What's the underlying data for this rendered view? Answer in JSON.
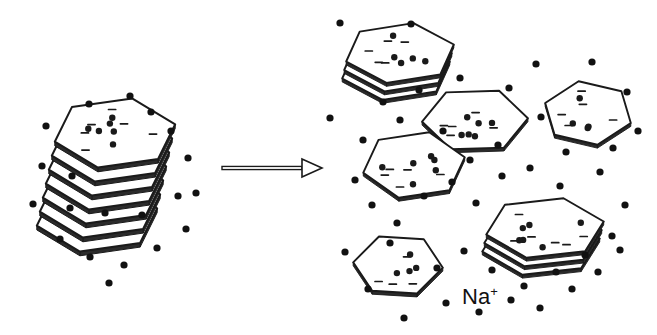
{
  "figure": {
    "background_color": "#ffffff",
    "ink_color": "#1a1a1a",
    "ion_color": "#111111",
    "platelet_face_color": "#ffffff",
    "edge_shadow_color": "#2b2b2b"
  },
  "labels": {
    "sodium_ion": "Na",
    "sodium_charge": "+"
  },
  "arrow": {
    "name": "process-arrow",
    "x1": 222,
    "y1": 168,
    "x2": 322,
    "y2": 168,
    "direction": "right",
    "style": "outlined-shaft-hollow-head"
  },
  "chart_data": {
    "type": "diagram",
    "stacks": [
      {
        "name": "intercalated-stack",
        "side": "left",
        "cx": 115,
        "cy": 175,
        "layers": 7,
        "layer_offset_x": -3.0,
        "layer_offset_y": 14.0,
        "scale": 1.0,
        "rotation": -4,
        "hex_radius": 62,
        "face_dots": 6,
        "face_dashes": 6
      }
    ],
    "platelets": [
      {
        "name": "platelet-top-right",
        "cx": 400,
        "cy": 53,
        "radius": 56,
        "rotation": -6,
        "layers": 3,
        "squash": 0.55,
        "face_dots": 5,
        "face_dashes": 5
      },
      {
        "name": "platelet-center-upper",
        "cx": 475,
        "cy": 120,
        "radius": 53,
        "rotation": 7,
        "layers": 1,
        "squash": 0.62,
        "face_dots": 6,
        "face_dashes": 5
      },
      {
        "name": "platelet-center-left",
        "cx": 414,
        "cy": 165,
        "radius": 52,
        "rotation": -3,
        "layers": 1,
        "squash": 0.66,
        "face_dots": 6,
        "face_dashes": 5
      },
      {
        "name": "platelet-right-edge",
        "cx": 588,
        "cy": 113,
        "radius": 45,
        "rotation": 28,
        "layers": 1,
        "squash": 0.72,
        "face_dots": 4,
        "face_dashes": 5
      },
      {
        "name": "platelet-bottom-left",
        "cx": 398,
        "cy": 265,
        "radius": 45,
        "rotation": 15,
        "layers": 1,
        "squash": 0.7,
        "face_dots": 4,
        "face_dashes": 4
      },
      {
        "name": "platelet-bottom-right-stack",
        "cx": 545,
        "cy": 228,
        "radius": 60,
        "rotation": -2,
        "layers": 3,
        "squash": 0.52,
        "face_dots": 6,
        "face_dashes": 6
      }
    ],
    "ions": {
      "label": "Na+",
      "radius": 3.6,
      "count_left": 20,
      "count_right": 48,
      "positions_left": [
        [
          46,
          126
        ],
        [
          89,
          104
        ],
        [
          130,
          96
        ],
        [
          42,
          166
        ],
        [
          33,
          204
        ],
        [
          60,
          239
        ],
        [
          90,
          257
        ],
        [
          124,
          265
        ],
        [
          157,
          248
        ],
        [
          186,
          229
        ],
        [
          196,
          193
        ],
        [
          188,
          158
        ],
        [
          171,
          131
        ],
        [
          151,
          112
        ],
        [
          109,
          283
        ],
        [
          70,
          208
        ],
        [
          105,
          213
        ],
        [
          72,
          176
        ],
        [
          142,
          215
        ],
        [
          178,
          196
        ]
      ],
      "positions_right": [
        [
          340,
          23
        ],
        [
          411,
          24
        ],
        [
          383,
          102
        ],
        [
          419,
          90
        ],
        [
          460,
          78
        ],
        [
          509,
          88
        ],
        [
          536,
          64
        ],
        [
          592,
          62
        ],
        [
          627,
          92
        ],
        [
          638,
          131
        ],
        [
          613,
          148
        ],
        [
          566,
          152
        ],
        [
          541,
          117
        ],
        [
          498,
          145
        ],
        [
          470,
          160
        ],
        [
          443,
          131
        ],
        [
          400,
          120
        ],
        [
          363,
          140
        ],
        [
          355,
          180
        ],
        [
          372,
          205
        ],
        [
          397,
          223
        ],
        [
          424,
          196
        ],
        [
          452,
          182
        ],
        [
          476,
          203
        ],
        [
          502,
          176
        ],
        [
          530,
          168
        ],
        [
          560,
          186
        ],
        [
          600,
          172
        ],
        [
          625,
          205
        ],
        [
          612,
          236
        ],
        [
          585,
          255
        ],
        [
          556,
          272
        ],
        [
          524,
          286
        ],
        [
          492,
          270
        ],
        [
          464,
          251
        ],
        [
          437,
          268
        ],
        [
          446,
          303
        ],
        [
          479,
          312
        ],
        [
          511,
          300
        ],
        [
          540,
          308
        ],
        [
          572,
          289
        ],
        [
          598,
          272
        ],
        [
          620,
          250
        ],
        [
          390,
          243
        ],
        [
          368,
          289
        ],
        [
          404,
          318
        ],
        [
          330,
          118
        ],
        [
          345,
          252
        ]
      ]
    }
  }
}
